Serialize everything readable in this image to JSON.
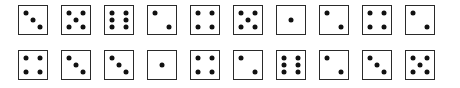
{
  "dice": {
    "rows": [
      {
        "values": [
          3,
          5,
          6,
          2,
          4,
          5,
          1,
          2,
          4,
          2
        ]
      },
      {
        "values": [
          4,
          3,
          3,
          1,
          4,
          2,
          6,
          2,
          3,
          5
        ]
      }
    ]
  },
  "colors": {
    "pip": "#111111",
    "border": "#2a2a2a",
    "background": "#ffffff"
  }
}
